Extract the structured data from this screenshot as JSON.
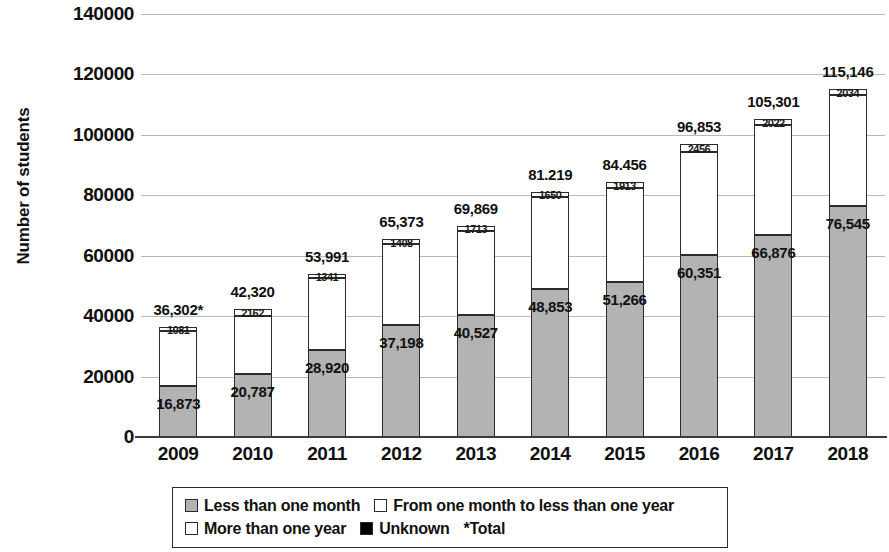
{
  "chart_data": {
    "type": "bar",
    "subtype": "stacked-vertical",
    "title": "",
    "xlabel": "",
    "ylabel": "Number of students",
    "ylim": [
      0,
      140000
    ],
    "ytick_step": 20000,
    "ytick_labels": [
      "140000",
      "120000",
      "100000",
      "80000",
      "60000",
      "40000",
      "20000",
      "0"
    ],
    "ytick_values": [
      140000,
      120000,
      100000,
      80000,
      60000,
      40000,
      20000,
      0
    ],
    "grid": true,
    "legend_position": "bottom",
    "categories": [
      "2009",
      "2010",
      "2011",
      "2012",
      "2013",
      "2014",
      "2015",
      "2016",
      "2017",
      "2018"
    ],
    "series": [
      {
        "name": "Less than one month",
        "color": "#b3b3b3",
        "values": [
          16873,
          20787,
          28920,
          37198,
          40527,
          48853,
          51266,
          60351,
          66876,
          76545
        ],
        "labels": [
          "16,873",
          "20,787",
          "28,920",
          "37,198",
          "40,527",
          "48,853",
          "51,266",
          "60,351",
          "66,876",
          "76,545"
        ]
      },
      {
        "name": "From one month to less than one year",
        "color": "#ffffff",
        "values": [
          18348,
          19371,
          23730,
          26767,
          27629,
          30716,
          31277,
          34046,
          36403,
          36567
        ],
        "labels": [
          "",
          "",
          "",
          "",
          "",
          "",
          "",
          "",
          "",
          ""
        ]
      },
      {
        "name": "More than one year",
        "color": "#ffffff",
        "values": [
          1081,
          2162,
          1341,
          1408,
          1713,
          1650,
          1913,
          2456,
          2022,
          2034
        ],
        "labels": [
          "1081",
          "2162",
          "1341",
          "1408",
          "1713",
          "1650",
          "1913",
          "2456",
          "2022",
          "2034"
        ]
      },
      {
        "name": "Unknown",
        "color": "#000000",
        "values": [
          0,
          0,
          0,
          0,
          0,
          0,
          0,
          0,
          0,
          0
        ],
        "labels": [
          "",
          "",
          "",
          "",
          "",
          "",
          "",
          "",
          "",
          ""
        ]
      }
    ],
    "totals": [
      36302,
      42320,
      53991,
      65373,
      69869,
      81219,
      84456,
      96853,
      105301,
      115146
    ],
    "total_labels": [
      "36,302*",
      "42,320",
      "53,991",
      "65,373",
      "69,869",
      "81.219",
      "84.456",
      "96,853",
      "105,301",
      "115,146"
    ],
    "annotations": [
      "*Total"
    ]
  },
  "legend": {
    "rows": [
      [
        {
          "label": "Less than one month",
          "swatch": "gray"
        },
        {
          "label": "From one month to less than one year",
          "swatch": "white"
        }
      ],
      [
        {
          "label": "More than one year",
          "swatch": "light"
        },
        {
          "label": "Unknown",
          "swatch": "black"
        }
      ]
    ],
    "note": "*Total"
  }
}
